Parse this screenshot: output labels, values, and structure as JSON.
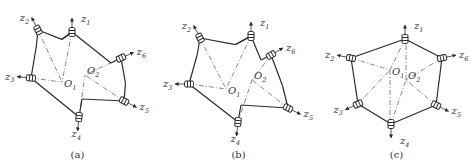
{
  "figure": {
    "panels": [
      {
        "id": "a",
        "caption": "(a)",
        "centers": [
          {
            "label": "O",
            "sub": "1",
            "x": 62,
            "y": 82
          },
          {
            "label": "O",
            "sub": "2",
            "x": 85,
            "y": 75
          }
        ],
        "sensors": [
          {
            "label": "z",
            "sub": "1",
            "x": 72,
            "y": 32,
            "dx": 0,
            "dy": -1
          },
          {
            "label": "z",
            "sub": "2",
            "x": 38,
            "y": 30,
            "dx": -0.45,
            "dy": -0.9
          },
          {
            "label": "z",
            "sub": "3",
            "x": 31,
            "y": 78,
            "dx": -1,
            "dy": -0.1
          },
          {
            "label": "z",
            "sub": "4",
            "x": 79,
            "y": 117,
            "dx": -0.1,
            "dy": 1
          },
          {
            "label": "z",
            "sub": "5",
            "x": 124,
            "y": 101,
            "dx": 0.9,
            "dy": 0.45
          },
          {
            "label": "z",
            "sub": "6",
            "x": 121,
            "y": 58,
            "dx": 0.9,
            "dy": -0.4
          }
        ]
      },
      {
        "id": "b",
        "caption": "(b)",
        "centers": [
          {
            "label": "O",
            "sub": "1",
            "x": 226,
            "y": 89
          },
          {
            "label": "O",
            "sub": "2",
            "x": 252,
            "y": 80
          }
        ],
        "sensors": [
          {
            "label": "z",
            "sub": "1",
            "x": 251,
            "y": 36,
            "dx": 0,
            "dy": -1
          },
          {
            "label": "z",
            "sub": "2",
            "x": 200,
            "y": 38,
            "dx": -0.45,
            "dy": -0.9
          },
          {
            "label": "z",
            "sub": "3",
            "x": 189,
            "y": 84,
            "dx": -1,
            "dy": 0
          },
          {
            "label": "z",
            "sub": "4",
            "x": 238,
            "y": 122,
            "dx": -0.1,
            "dy": 1
          },
          {
            "label": "z",
            "sub": "5",
            "x": 288,
            "y": 108,
            "dx": 0.9,
            "dy": 0.45
          },
          {
            "label": "z",
            "sub": "6",
            "x": 271,
            "y": 55,
            "dx": 0.85,
            "dy": -0.5
          }
        ]
      },
      {
        "id": "c",
        "caption": "(c)",
        "centers": [
          {
            "label": "O",
            "sub": "1",
            "x": 390,
            "y": 70
          },
          {
            "label": "O",
            "sub": "2",
            "x": 406,
            "y": 80
          }
        ],
        "sensors": [
          {
            "label": "z",
            "sub": "1",
            "x": 405,
            "y": 39,
            "dx": 0,
            "dy": -1
          },
          {
            "label": "z",
            "sub": "2",
            "x": 351,
            "y": 58,
            "dx": -1,
            "dy": -0.2
          },
          {
            "label": "z",
            "sub": "3",
            "x": 358,
            "y": 104,
            "dx": -0.9,
            "dy": 0.4
          },
          {
            "label": "z",
            "sub": "4",
            "x": 391,
            "y": 124,
            "dx": 0,
            "dy": 1
          },
          {
            "label": "z",
            "sub": "5",
            "x": 436,
            "y": 105,
            "dx": 0.9,
            "dy": 0.45
          },
          {
            "label": "z",
            "sub": "6",
            "x": 442,
            "y": 58,
            "dx": 1,
            "dy": -0.2
          }
        ]
      }
    ]
  }
}
